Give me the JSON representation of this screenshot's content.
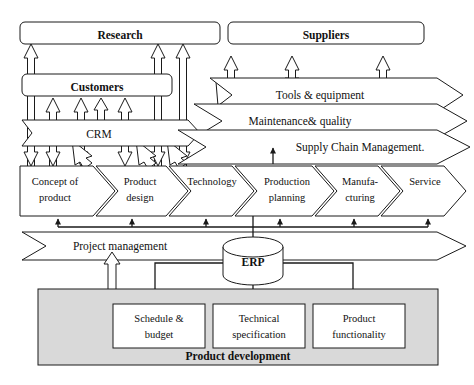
{
  "diagram": {
    "colors": {
      "stroke": "#1a1a1a",
      "fill_white": "#ffffff",
      "fill_shaded": "#d9d9d9",
      "text": "#111111"
    },
    "stakeholders": [
      {
        "id": "research",
        "label": "Research",
        "shape": "rounded-rect"
      },
      {
        "id": "suppliers",
        "label": "Suppliers",
        "shape": "rounded-rect"
      },
      {
        "id": "customers",
        "label": "Customers",
        "shape": "rounded-rect"
      }
    ],
    "flow_bands": [
      {
        "id": "crm",
        "label": "CRM",
        "shape": "arrow-band"
      },
      {
        "id": "tools-equipment",
        "label": "Tools & equipment",
        "shape": "arrow-band"
      },
      {
        "id": "maintenance-quality",
        "label": "Maintenance& quality",
        "shape": "arrow-band"
      },
      {
        "id": "supply-chain-management",
        "label": "Supply Chain Management.",
        "shape": "arrow-band"
      },
      {
        "id": "project-management",
        "label": "Project management",
        "shape": "arrow-band"
      }
    ],
    "process_chevrons": [
      {
        "id": "concept-of-product",
        "line1": "Concept of",
        "line2": "product"
      },
      {
        "id": "product-design",
        "line1": "Product",
        "line2": "design"
      },
      {
        "id": "technology",
        "line1": "Technology",
        "line2": ""
      },
      {
        "id": "production-planning",
        "line1": "Production",
        "line2": "planning"
      },
      {
        "id": "manufacturing",
        "line1": "Manufa-",
        "line2": "cturing"
      },
      {
        "id": "service",
        "line1": "Service",
        "line2": ""
      }
    ],
    "database": {
      "id": "erp",
      "label": "ERP",
      "shape": "cylinder"
    },
    "product_development": {
      "id": "product-development",
      "label": "Product development",
      "items": [
        {
          "id": "schedule-budget",
          "line1": "Schedule &",
          "line2": "budget"
        },
        {
          "id": "technical-specification",
          "line1": "Technical",
          "line2": "specification"
        },
        {
          "id": "product-functionality",
          "line1": "Product",
          "line2": "functionality"
        }
      ]
    }
  }
}
